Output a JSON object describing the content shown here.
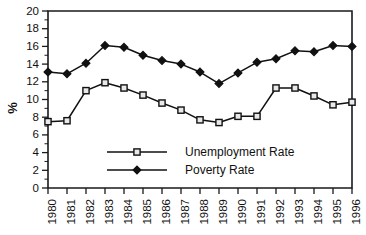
{
  "chart_data": {
    "type": "line",
    "title": "",
    "xlabel": "",
    "ylabel": "%",
    "categories": [
      "1980",
      "1981",
      "1982",
      "1983",
      "1984",
      "1985",
      "1986",
      "1987",
      "1988",
      "1989",
      "1990",
      "1991",
      "1992",
      "1993",
      "1994",
      "1995",
      "1996"
    ],
    "ylim": [
      0,
      20
    ],
    "ytick_step": 2,
    "yminor_step": 1,
    "grid": false,
    "legend_position": "inside-lower-center",
    "ytick_labels": [
      "0",
      "2",
      "4",
      "6",
      "8",
      "10",
      "12",
      "14",
      "16",
      "18",
      "20"
    ],
    "series": [
      {
        "name": "Unemployment Rate",
        "marker": "open-square",
        "values": [
          7.5,
          7.6,
          11.0,
          11.9,
          11.3,
          10.5,
          9.6,
          8.8,
          7.7,
          7.4,
          8.1,
          8.1,
          11.3,
          11.3,
          10.4,
          9.4,
          9.7
        ]
      },
      {
        "name": "Poverty Rate",
        "marker": "solid-diamond",
        "values": [
          13.1,
          12.9,
          14.1,
          16.1,
          15.9,
          15.0,
          14.4,
          14.0,
          13.1,
          11.8,
          13.0,
          14.2,
          14.6,
          15.5,
          15.4,
          16.1,
          16.0
        ]
      }
    ]
  },
  "legend": {
    "items": [
      {
        "label": "Unemployment Rate"
      },
      {
        "label": "Poverty Rate"
      }
    ]
  },
  "colors": {
    "axis": "#111111",
    "series_line": "#111111",
    "open_marker_fill": "#e9e9e9",
    "background": "#ffffff"
  }
}
